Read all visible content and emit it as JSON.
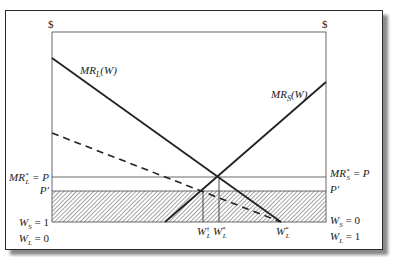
{
  "diagram": {
    "axis_symbols": {
      "left": "$",
      "right": "$"
    },
    "curves": {
      "mr_l": {
        "name": "MR",
        "sub": "L",
        "arg": "(W)"
      },
      "mr_s": {
        "name": "MR",
        "sub": "S",
        "arg": "(W)"
      },
      "dashed": {
        "description": "dashed line from left axis to W_L^*"
      }
    },
    "left_labels": {
      "mr_l_star": {
        "main": "MR",
        "sup": "*",
        "sub": "L",
        "rest": " = P"
      },
      "p_prime": "P′",
      "ws1": {
        "main": "W",
        "sub": "S",
        "rest": " = 1"
      },
      "wl0": {
        "main": "W",
        "sub": "L",
        "rest": " = 0"
      }
    },
    "right_labels": {
      "mr_s_star": {
        "main": "MR",
        "sup": "*",
        "sub": "S",
        "rest": " = P"
      },
      "p_prime": "P′",
      "ws0": {
        "main": "W",
        "sub": "S",
        "rest": " = 0"
      },
      "wl1": {
        "main": "W",
        "sub": "L",
        "rest": " = 1"
      }
    },
    "bottom_labels": [
      {
        "main": "W",
        "sup": "†",
        "sub": "L"
      },
      {
        "main": "W",
        "sup": "*",
        "sub": "L"
      },
      {
        "main": "W",
        "sup": "*",
        "sub": "L"
      }
    ],
    "colors": {
      "line": "#222222",
      "hatch": "#555555",
      "frame": "#2a2a2a",
      "shadow": "#8a8a8a"
    }
  }
}
